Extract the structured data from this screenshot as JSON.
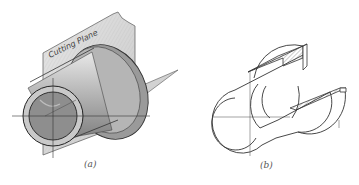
{
  "figure_a": {
    "caption": "(a)",
    "plane_label": "Cutting Plane",
    "description": "Isometric shaded view of a flanged cylindrical bushing with a vertical cutting plane passing through its axis and a horizontal half-plane"
  },
  "figure_b": {
    "caption": "(b)",
    "description": "Isometric half-section line drawing of the bushing with cross-hatched cut surfaces"
  },
  "colors": {
    "line": "#333333",
    "shade_dark": "#8a8a8a",
    "shade_mid": "#b8b8b8",
    "shade_light": "#dcdcdc",
    "background": "#ffffff"
  }
}
